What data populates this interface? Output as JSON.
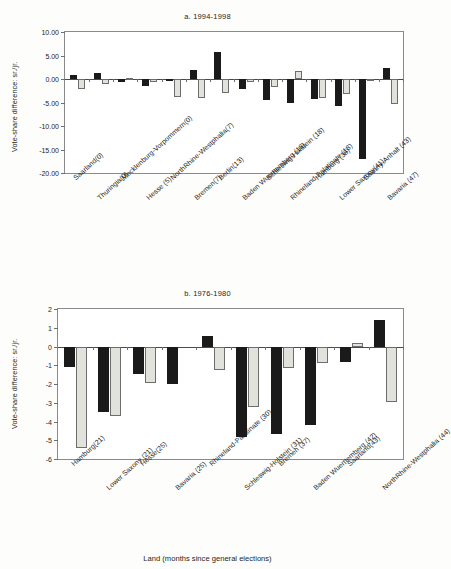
{
  "figure": {
    "xlabel": "Land (months since general elections)"
  },
  "chart_data": [
    {
      "type": "bar",
      "panel": "a",
      "title": "a. 1994-1998",
      "ylabel": "Vote-share difference: sr./jr.",
      "xlabel": "",
      "ylim": [
        -20,
        10
      ],
      "yticks": [
        "10.00",
        "5.00",
        "0.00",
        "-5.00",
        "-10.00",
        "-15.00",
        "-20.00"
      ],
      "ytick_values": [
        10,
        5,
        0,
        -5,
        -10,
        -15,
        -20
      ],
      "grid": false,
      "legend": "none",
      "categories": [
        "Saarland(0)",
        "Thuringia(0)",
        "Mecklenburg-Vorpommern(0)",
        "Hesse (5)",
        "NorthRhine-Westphalia(7)",
        "Bremen(7)",
        "Berlin(13)",
        "Baden Wuerttemberg (18)",
        "Schleswig-Holstein (18)",
        "Rhineland-Palatinate (18)",
        "Hamburg (36)",
        "Lower Saxony(41)",
        "Saxony-Anhalt (43)",
        "Bavaria (47)"
      ],
      "series": [
        {
          "name": "sr.",
          "color": "#1a1a1a",
          "values": [
            0.9,
            1.2,
            -0.6,
            -1.5,
            -0.4,
            2.0,
            5.7,
            -2.1,
            -4.5,
            -5.2,
            -4.3,
            -5.7,
            -17.1,
            2.4
          ]
        },
        {
          "name": "jr.",
          "color": "#e2e2dd",
          "values": [
            -2.1,
            -1.0,
            0.2,
            -0.7,
            -3.8,
            -4.0,
            -2.9,
            -0.6,
            -1.8,
            1.6,
            -4.0,
            -3.2,
            -0.2,
            -5.3
          ]
        }
      ]
    },
    {
      "type": "bar",
      "panel": "b",
      "title": "b. 1976-1980",
      "ylabel": "Vote-share difference: sr./jr.",
      "xlabel": "Land (months since general elections)",
      "ylim": [
        -6,
        2
      ],
      "yticks": [
        "2",
        "1",
        "0",
        "-1",
        "-2",
        "-3",
        "-4",
        "-5",
        "-6"
      ],
      "ytick_values": [
        2,
        1,
        0,
        -1,
        -2,
        -3,
        -4,
        -5,
        -6
      ],
      "grid": false,
      "legend": "none",
      "categories": [
        "Hamburg(21)",
        "Lower Saxony (21)",
        "Hesse(25)",
        "Bavaria (25)",
        "Rhineland-Palatinate (30)",
        "Schleswig-Holstein (31)",
        "Bremen (37)",
        "Baden Wuerttemberg (42)",
        "Saarland(43)",
        "NorthRhine-Westphalia (44)"
      ],
      "series": [
        {
          "name": "sr.",
          "color": "#1a1a1a",
          "values": [
            -1.1,
            -3.5,
            -1.45,
            -2.0,
            0.55,
            -4.8,
            -4.65,
            -4.2,
            -0.8,
            1.4
          ]
        },
        {
          "name": "jr.",
          "color": "#e2e2dd",
          "values": [
            -5.4,
            -3.7,
            -1.95,
            0.0,
            -1.25,
            -3.2,
            -1.15,
            -0.9,
            0.2,
            -2.95
          ]
        }
      ]
    }
  ]
}
